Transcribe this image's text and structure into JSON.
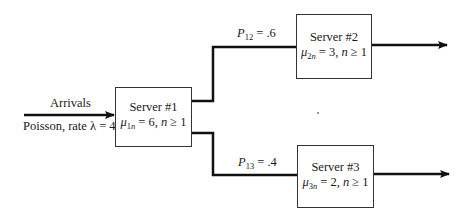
{
  "diagram": {
    "type": "queueing-network",
    "input": {
      "label_top": "Arrivals",
      "label_bottom": "Poisson, rate λ = 4"
    },
    "servers": [
      {
        "id": 1,
        "title": "Server #1",
        "mu_symbol": "μ",
        "mu_sub_num": "1",
        "mu_sub_var": "n",
        "rate_rest": " = 6, ",
        "cond_var": "n",
        "cond_rest": " ≥ 1"
      },
      {
        "id": 2,
        "title": "Server #2",
        "mu_symbol": "μ",
        "mu_sub_num": "2",
        "mu_sub_var": "n",
        "rate_rest": " = 3, ",
        "cond_var": "n",
        "cond_rest": " ≥ 1"
      },
      {
        "id": 3,
        "title": "Server #3",
        "mu_symbol": "μ",
        "mu_sub_num": "3",
        "mu_sub_var": "n",
        "rate_rest": " = 2, ",
        "cond_var": "n",
        "cond_rest": " ≥ 1"
      }
    ],
    "routing": [
      {
        "from": 1,
        "to": 2,
        "p_symbol": "P",
        "p_sub": "12",
        "p_rest": " = .6"
      },
      {
        "from": 1,
        "to": 3,
        "p_symbol": "P",
        "p_sub": "13",
        "p_rest": " = .4"
      }
    ],
    "colors": {
      "line": "#111111",
      "box_border": "#333333",
      "background": "#ffffff"
    }
  }
}
